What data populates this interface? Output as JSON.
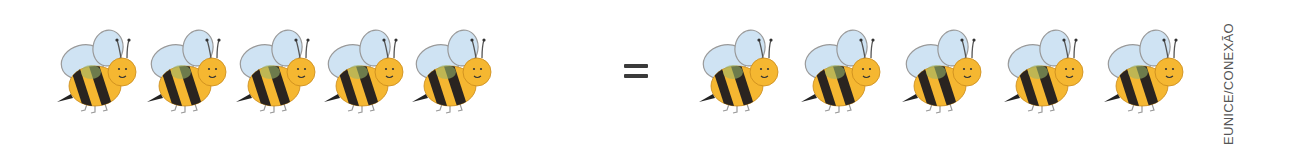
{
  "equation": {
    "left_group": {
      "count": 5,
      "item": "bee"
    },
    "operator": "=",
    "right_group": {
      "count": 5,
      "item": "bee"
    }
  },
  "credit": "EUNICE/CONEXÃO",
  "colors": {
    "bee_body": "#f5b731",
    "bee_stripe": "#2a2420",
    "bee_wing": "#cfe3f3",
    "wing_outline": "#9a9a9a",
    "equals": "#3a3a3a"
  }
}
